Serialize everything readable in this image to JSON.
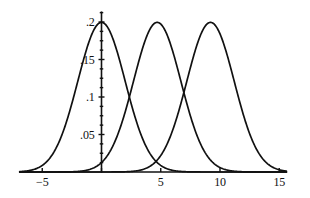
{
  "chart_data": {
    "type": "line",
    "title": "",
    "subtitle": "",
    "xlabel": "",
    "ylabel": "",
    "xlim": [
      -6.9,
      15.6
    ],
    "ylim": [
      0,
      0.213
    ],
    "grid": false,
    "legend": false,
    "legend_position": "none",
    "axis_style": "bare-axes-with-ticks",
    "line_color": "#111111",
    "axis_color": "#111111",
    "background_color": "#ffffff",
    "x_ticks": [
      {
        "value": -5,
        "label": "−5"
      },
      {
        "value": 5,
        "label": "5"
      },
      {
        "value": 10,
        "label": "10"
      },
      {
        "value": 15,
        "label": "15"
      }
    ],
    "x_minor_ticks": [
      -5,
      0,
      5,
      10,
      15
    ],
    "y_ticks": [
      {
        "value": 0.05,
        "label": ".05"
      },
      {
        "value": 0.1,
        "label": ".1"
      },
      {
        "value": 0.15,
        "label": ".15"
      },
      {
        "value": 0.2,
        "label": ".2"
      }
    ],
    "y_minor_tick_step": 0.0125,
    "series": [
      {
        "name": "curve-1",
        "distribution": "normal",
        "mean": 0,
        "sigma": 2,
        "peak_value": 0.1995,
        "peak_x": 0
      },
      {
        "name": "curve-2",
        "distribution": "normal",
        "mean": 4.7,
        "sigma": 2,
        "peak_value": 0.1995,
        "peak_x": 4.7
      },
      {
        "name": "curve-3",
        "distribution": "normal",
        "mean": 9.2,
        "sigma": 2,
        "peak_value": 0.1995,
        "peak_x": 9.2
      }
    ],
    "annotations": [
      {
        "name": "crossing-1-2",
        "x": 2.35,
        "y": 0.117
      },
      {
        "name": "crossing-2-3",
        "x": 6.95,
        "y": 0.12
      }
    ]
  }
}
